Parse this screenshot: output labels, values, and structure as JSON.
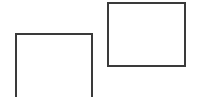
{
  "diagram": {
    "shapes": [
      {
        "id": "left",
        "type": "rectangle",
        "x": 15,
        "y": 33,
        "width": 78,
        "height": 70,
        "stroke": "#3a3a3a",
        "fill": "#ffffff"
      },
      {
        "id": "right",
        "type": "rectangle",
        "x": 107,
        "y": 2,
        "width": 79,
        "height": 65,
        "stroke": "#3a3a3a",
        "fill": "#ffffff"
      }
    ]
  }
}
